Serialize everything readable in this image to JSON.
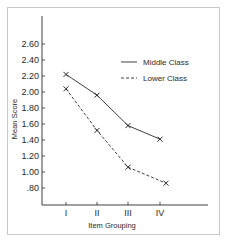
{
  "chart_data": {
    "type": "line",
    "title": "",
    "xlabel": "Item Grouping",
    "ylabel": "Mean Score",
    "categories": [
      "I",
      "II",
      "III",
      "IV"
    ],
    "yticks": [
      ".80",
      "1.00",
      "1.20",
      "1.40",
      "1.60",
      "1.80",
      "2.00",
      "2.20",
      "2.40",
      "2.60"
    ],
    "ylim": [
      0.8,
      2.6
    ],
    "grid": false,
    "legend_position": "upper right",
    "values_are_approximate": true,
    "series": [
      {
        "name": "Middle Class",
        "style": "solid",
        "marker": "x",
        "values": [
          2.22,
          1.96,
          1.58,
          1.41
        ]
      },
      {
        "name": "Lower Class",
        "style": "dashed",
        "marker": "x",
        "values": [
          2.04,
          1.52,
          1.06,
          0.86
        ]
      }
    ]
  },
  "colors": {
    "line": "#2a2a2a",
    "frame": "#c8c8c8",
    "background": "#ffffff"
  }
}
